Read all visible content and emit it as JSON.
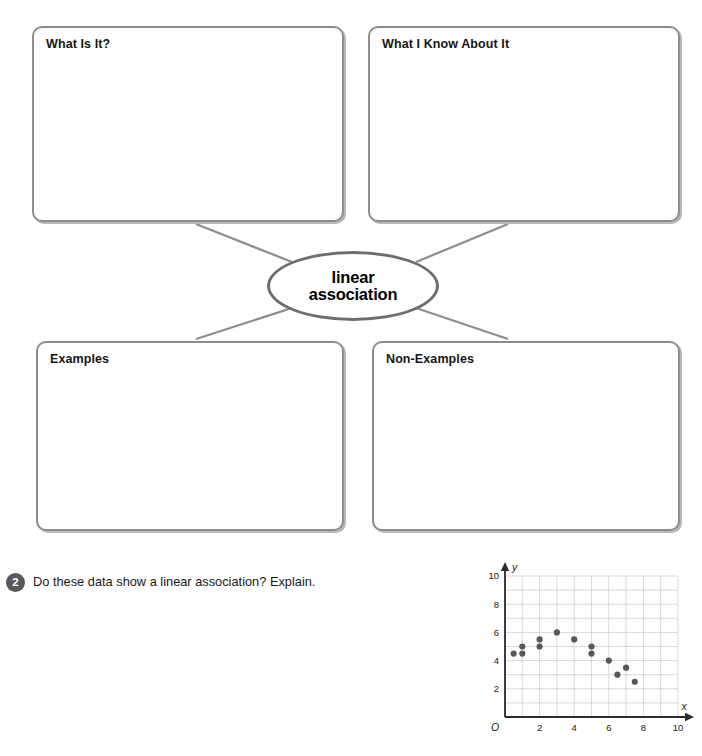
{
  "concept_map": {
    "center_term": "linear\nassociation",
    "boxes": [
      {
        "id": "what-is-it",
        "title": "What Is It?"
      },
      {
        "id": "what-i-know",
        "title": "What I Know About It"
      },
      {
        "id": "examples",
        "title": "Examples"
      },
      {
        "id": "non-examples",
        "title": "Non-Examples"
      }
    ]
  },
  "question": {
    "number": "2",
    "text": "Do these data show a linear association? Explain."
  },
  "colors": {
    "box_border": "#8d8d8d",
    "oval_border": "#6e6e6e",
    "connector": "#8d8d8d",
    "badge": "#58595b",
    "grid": "#c9c9c9",
    "axis": "#2b2b2b",
    "point": "#58585a"
  },
  "chart_data": {
    "type": "scatter",
    "title": "",
    "xlabel": "x",
    "ylabel": "y",
    "origin_label": "O",
    "xlim": [
      0,
      10
    ],
    "ylim": [
      0,
      10
    ],
    "xticks": [
      2,
      4,
      6,
      8,
      10
    ],
    "yticks": [
      2,
      4,
      6,
      8,
      10
    ],
    "grid": true,
    "grid_step": 1,
    "legend": "none",
    "points": [
      {
        "x": 0.5,
        "y": 4.5
      },
      {
        "x": 1.0,
        "y": 4.5
      },
      {
        "x": 1.0,
        "y": 5.0
      },
      {
        "x": 2.0,
        "y": 5.0
      },
      {
        "x": 2.0,
        "y": 5.5
      },
      {
        "x": 3.0,
        "y": 6.0
      },
      {
        "x": 4.0,
        "y": 5.5
      },
      {
        "x": 5.0,
        "y": 5.0
      },
      {
        "x": 5.0,
        "y": 4.5
      },
      {
        "x": 6.0,
        "y": 4.0
      },
      {
        "x": 6.5,
        "y": 3.0
      },
      {
        "x": 7.0,
        "y": 3.5
      },
      {
        "x": 7.5,
        "y": 2.5
      }
    ]
  }
}
